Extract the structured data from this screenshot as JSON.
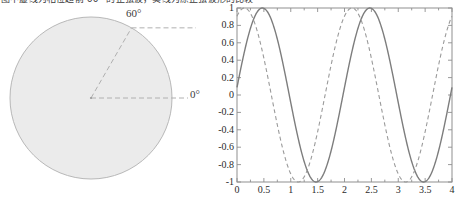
{
  "caption": {
    "text": "图中虚线为相位超前 60° 的正弦波，实线为原正弦波形的比较"
  },
  "circle_diagram": {
    "name": "phase-circle",
    "fill_color": "#ebebeb",
    "stroke_color": "#b8b8b8",
    "dash_color": "#b0b0b0",
    "center": {
      "x": 91,
      "y": 92
    },
    "radius": 81,
    "angle_labels": {
      "upper": "60°",
      "reference": "0°"
    },
    "upper_angle_deg": 60,
    "reference_angle_deg": 0
  },
  "chart_data": {
    "type": "line",
    "title": "",
    "xlabel": "",
    "ylabel": "",
    "xlim": [
      0,
      4
    ],
    "ylim": [
      -1,
      1
    ],
    "grid": false,
    "legend": "none",
    "frame": true,
    "x_ticks": [
      "0",
      "0.5",
      "1",
      "1.5",
      "2",
      "2.5",
      "3",
      "3.5",
      "4"
    ],
    "x_tick_values": [
      0,
      0.5,
      1,
      1.5,
      2,
      2.5,
      3,
      3.5,
      4
    ],
    "y_ticks": [
      "1",
      "0.8",
      "0.6",
      "0.4",
      "0.2",
      "0",
      "-0.2",
      "-0.4",
      "-0.6",
      "-0.8",
      "-1"
    ],
    "y_tick_values": [
      1,
      0.8,
      0.6,
      0.4,
      0.2,
      0,
      -0.2,
      -0.4,
      -0.6,
      -0.8,
      -1
    ],
    "series": [
      {
        "name": "reference-sine",
        "style": "solid",
        "color": "#7d7d7d",
        "amplitude": 1,
        "period": 2,
        "phase_deg": 5,
        "description": "sin(pi*x + 5deg): peaks at x=0.5 and 2.5, troughs at x=1.5 and 3.5, y(0)=0.09",
        "x": [
          0,
          0.25,
          0.5,
          0.75,
          1,
          1.25,
          1.5,
          1.75,
          2,
          2.25,
          2.5,
          2.75,
          3,
          3.25,
          3.5,
          3.75,
          4
        ],
        "values": [
          0.09,
          0.77,
          1.0,
          0.7,
          -0.09,
          -0.77,
          -1.0,
          -0.7,
          0.09,
          0.77,
          1.0,
          0.7,
          -0.09,
          -0.77,
          -1.0,
          -0.7,
          0.09
        ]
      },
      {
        "name": "phase-advanced-sine",
        "style": "dashed",
        "color": "#9a9a9a",
        "amplitude": 1,
        "period": 2,
        "phase_deg": 65,
        "description": "sin(pi*x + 65deg): leads the solid curve by 60 degrees, peaks near x=0.25 and 2.25",
        "x": [
          0,
          0.25,
          0.5,
          0.75,
          1,
          1.25,
          1.5,
          1.75,
          2,
          2.25,
          2.5,
          2.75,
          3,
          3.25,
          3.5,
          3.75,
          4
        ],
        "values": [
          0.91,
          1.0,
          0.42,
          -0.42,
          -0.91,
          -1.0,
          -0.42,
          0.42,
          0.91,
          1.0,
          0.42,
          -0.42,
          -0.91,
          -1.0,
          -0.42,
          0.42,
          0.91
        ]
      }
    ],
    "axes_box": {
      "left": 9,
      "top": 8,
      "right": 224,
      "bottom": 182
    }
  }
}
